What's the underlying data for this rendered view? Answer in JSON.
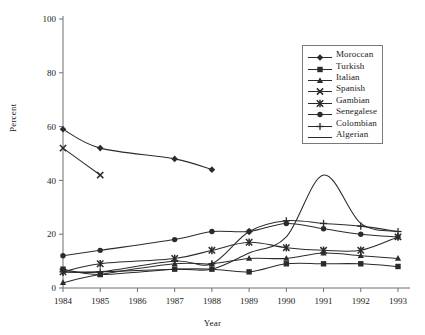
{
  "chart_data": {
    "type": "line",
    "title": "",
    "xlabel": "Year",
    "ylabel": "Percent",
    "grid": false,
    "legend_position": "top-right",
    "x": [
      1984,
      1985,
      1986,
      1987,
      1988,
      1989,
      1990,
      1991,
      1992,
      1993
    ],
    "xtick_labels": [
      "1984",
      "1985",
      "1986",
      "1987",
      "1988",
      "1989",
      "1990",
      "1991",
      "1992",
      "1993"
    ],
    "ytick_labels": [
      "0",
      "20",
      "40",
      "60",
      "80",
      "100"
    ],
    "ylim": [
      0,
      100
    ],
    "yticks": [
      0,
      20,
      40,
      60,
      80,
      100
    ],
    "series": [
      {
        "name": "Moroccan",
        "marker": "diamond",
        "x": [
          1984,
          1985,
          1987,
          1988
        ],
        "values": [
          59,
          52,
          48,
          44
        ]
      },
      {
        "name": "Turkish",
        "marker": "square",
        "x": [
          1984,
          1985,
          1987,
          1988,
          1989,
          1990,
          1991,
          1992,
          1993
        ],
        "values": [
          7,
          5,
          7,
          7,
          6,
          9,
          9,
          9,
          8
        ]
      },
      {
        "name": "Italian",
        "marker": "triangle",
        "x": [
          1984,
          1985,
          1987,
          1988,
          1989,
          1990,
          1991,
          1992,
          1993
        ],
        "values": [
          2,
          5,
          9,
          9,
          11,
          11,
          13,
          12,
          11
        ]
      },
      {
        "name": "Spanish",
        "marker": "x",
        "x": [
          1984,
          1985
        ],
        "values": [
          52,
          42
        ]
      },
      {
        "name": "Gambian",
        "marker": "star",
        "x": [
          1984,
          1985,
          1987,
          1988,
          1989,
          1990,
          1991,
          1992,
          1993
        ],
        "values": [
          6,
          9,
          11,
          14,
          17,
          15,
          14,
          14,
          19
        ]
      },
      {
        "name": "Senegalese",
        "marker": "circle",
        "x": [
          1984,
          1985,
          1987,
          1988,
          1989,
          1990,
          1991,
          1992,
          1993
        ],
        "values": [
          12,
          14,
          18,
          21,
          21,
          24,
          22,
          20,
          19
        ]
      },
      {
        "name": "Colombian",
        "marker": "plus",
        "x": [
          1984,
          1985,
          1987,
          1988,
          1989,
          1990,
          1991,
          1992,
          1993
        ],
        "values": [
          6,
          6,
          10,
          9,
          21,
          25,
          24,
          23,
          21
        ]
      },
      {
        "name": "Algerian",
        "marker": "none",
        "x": [
          1984,
          1985,
          1987,
          1988,
          1989,
          1990,
          1991,
          1992,
          1993
        ],
        "values": [
          6,
          6,
          7,
          7,
          13,
          19,
          42,
          24,
          21
        ]
      }
    ]
  },
  "legend": {
    "items": [
      {
        "label": "Moroccan"
      },
      {
        "label": "Turkish"
      },
      {
        "label": "Italian"
      },
      {
        "label": "Spanish"
      },
      {
        "label": "Gambian"
      },
      {
        "label": "Senegalese"
      },
      {
        "label": "Colombian"
      },
      {
        "label": "Algerian"
      }
    ]
  },
  "axis": {
    "y_title": "Percent",
    "x_title": "Year"
  },
  "style": {
    "line_color": "#2b2b2b",
    "axis_color": "#6f6f6f",
    "text_color": "#1a1a1a",
    "background": "#ffffff"
  }
}
